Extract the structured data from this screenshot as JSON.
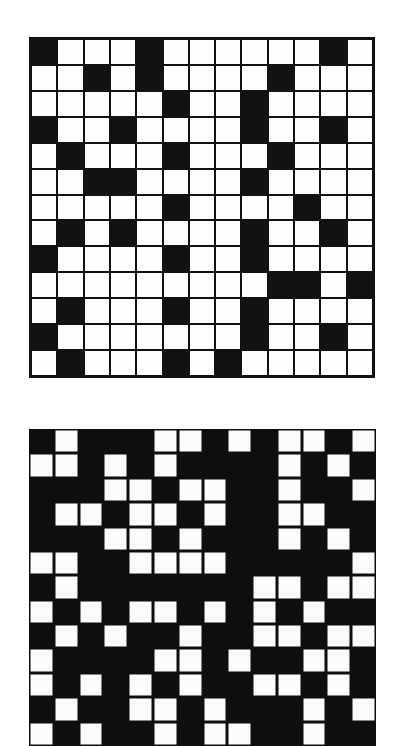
{
  "page": {
    "background_color": "#ffffff",
    "ink_color": "#111111",
    "paper_color": "#fdfdfb"
  },
  "figures": [
    {
      "name": "top-matrix",
      "style": "outlined-grid",
      "description": "13 by 13 grid of outlined square cells, a scattered subset filled solid black",
      "rows": 13,
      "cols": 13,
      "filled_color": "#121212",
      "empty_color": "#fdfdfb",
      "line_color": "#111111"
    },
    {
      "name": "bottom-matrix",
      "style": "inverted-blocks",
      "description": "14 by 13 field of solid black with a scattered subset of cells left white, no grid rules",
      "rows": 13,
      "cols": 14,
      "filled_color": "#fbfbf9",
      "empty_color": "#0e0e0e",
      "line_color": "#0e0e0e"
    }
  ],
  "chart_data": [
    {
      "type": "heatmap",
      "title": "Top matrix",
      "xlabel": "",
      "ylabel": "",
      "rows": 13,
      "cols": 13,
      "value_legend": {
        "0": "white cell",
        "1": "black cell"
      },
      "matrix": [
        [
          1,
          0,
          0,
          0,
          1,
          0,
          0,
          0,
          0,
          0,
          0,
          1,
          0
        ],
        [
          0,
          0,
          1,
          0,
          1,
          0,
          0,
          0,
          0,
          1,
          0,
          0,
          0
        ],
        [
          0,
          0,
          0,
          0,
          0,
          1,
          0,
          0,
          1,
          0,
          0,
          0,
          0
        ],
        [
          1,
          0,
          0,
          1,
          0,
          0,
          0,
          0,
          1,
          0,
          0,
          1,
          0
        ],
        [
          0,
          1,
          0,
          0,
          0,
          1,
          0,
          0,
          0,
          1,
          0,
          0,
          0
        ],
        [
          0,
          0,
          1,
          1,
          0,
          0,
          0,
          0,
          1,
          0,
          0,
          0,
          0
        ],
        [
          0,
          0,
          0,
          0,
          0,
          1,
          0,
          0,
          0,
          0,
          1,
          0,
          0
        ],
        [
          0,
          1,
          0,
          1,
          0,
          0,
          0,
          0,
          1,
          0,
          0,
          1,
          0
        ],
        [
          1,
          0,
          0,
          0,
          0,
          1,
          0,
          0,
          1,
          0,
          0,
          0,
          0
        ],
        [
          0,
          0,
          0,
          0,
          0,
          0,
          0,
          0,
          0,
          1,
          1,
          0,
          1
        ],
        [
          0,
          1,
          0,
          0,
          0,
          1,
          0,
          0,
          1,
          0,
          0,
          0,
          0
        ],
        [
          1,
          0,
          0,
          0,
          0,
          0,
          0,
          0,
          1,
          0,
          0,
          1,
          0
        ],
        [
          0,
          1,
          0,
          0,
          0,
          1,
          0,
          1,
          0,
          0,
          0,
          0,
          0
        ]
      ]
    },
    {
      "type": "heatmap",
      "title": "Bottom matrix",
      "xlabel": "",
      "ylabel": "",
      "rows": 13,
      "cols": 14,
      "value_legend": {
        "0": "black cell",
        "1": "white cell"
      },
      "matrix": [
        [
          0,
          1,
          0,
          0,
          0,
          1,
          1,
          0,
          1,
          0,
          1,
          1,
          0,
          1
        ],
        [
          1,
          1,
          0,
          1,
          0,
          1,
          0,
          0,
          0,
          0,
          1,
          0,
          1,
          0
        ],
        [
          0,
          0,
          0,
          1,
          1,
          0,
          1,
          1,
          0,
          0,
          1,
          0,
          0,
          1
        ],
        [
          0,
          1,
          1,
          0,
          1,
          1,
          0,
          1,
          0,
          0,
          1,
          1,
          0,
          0
        ],
        [
          0,
          0,
          0,
          1,
          1,
          0,
          1,
          0,
          0,
          0,
          1,
          0,
          1,
          0
        ],
        [
          1,
          1,
          0,
          0,
          1,
          1,
          1,
          1,
          0,
          0,
          0,
          0,
          0,
          1
        ],
        [
          0,
          1,
          0,
          0,
          0,
          0,
          0,
          0,
          0,
          1,
          1,
          0,
          1,
          1
        ],
        [
          1,
          0,
          1,
          0,
          1,
          1,
          0,
          1,
          0,
          1,
          0,
          1,
          0,
          0
        ],
        [
          0,
          1,
          0,
          1,
          0,
          0,
          1,
          0,
          0,
          1,
          1,
          0,
          1,
          1
        ],
        [
          1,
          0,
          0,
          0,
          0,
          1,
          1,
          0,
          1,
          0,
          0,
          1,
          1,
          0
        ],
        [
          1,
          0,
          1,
          0,
          1,
          0,
          1,
          0,
          0,
          1,
          1,
          0,
          1,
          0
        ],
        [
          0,
          1,
          0,
          0,
          1,
          1,
          0,
          1,
          0,
          0,
          0,
          1,
          0,
          1
        ],
        [
          1,
          0,
          1,
          0,
          0,
          1,
          0,
          1,
          1,
          0,
          0,
          1,
          0,
          0
        ]
      ]
    }
  ]
}
